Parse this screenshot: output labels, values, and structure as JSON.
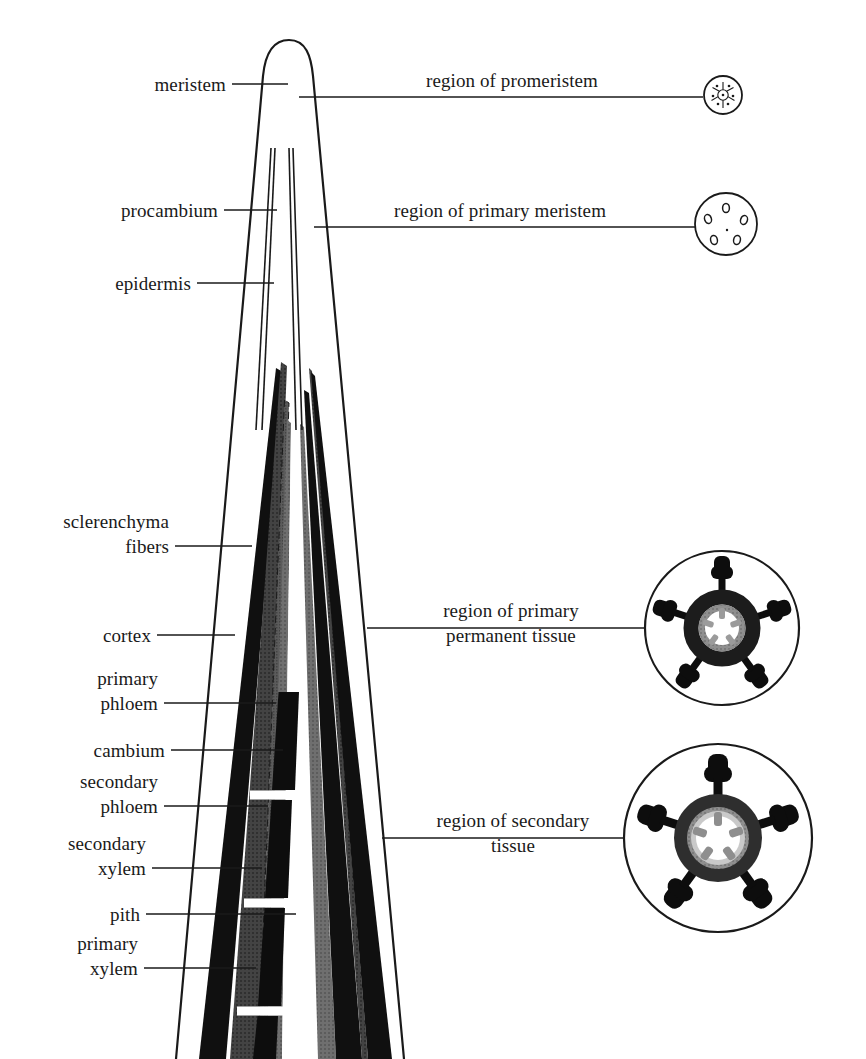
{
  "figure": {
    "background_color": "#ffffff",
    "line_color": "#1a1a1a"
  },
  "left_labels": [
    {
      "key": "meristem",
      "text": "meristem"
    },
    {
      "key": "procambium",
      "text": "procambium"
    },
    {
      "key": "epidermis",
      "text": "epidermis"
    },
    {
      "key": "sclerenchyma_fibers",
      "text": "sclerenchyma\nfibers"
    },
    {
      "key": "cortex",
      "text": "cortex"
    },
    {
      "key": "primary_phloem",
      "text": "primary\nphloem"
    },
    {
      "key": "cambium",
      "text": "cambium"
    },
    {
      "key": "secondary_phloem",
      "text": "secondary\nphloem"
    },
    {
      "key": "secondary_xylem",
      "text": "secondary\nxylem"
    },
    {
      "key": "pith",
      "text": "pith"
    },
    {
      "key": "primary_xylem",
      "text": "primary\nxylem"
    }
  ],
  "right_labels": [
    {
      "key": "promeristem",
      "text": "region of promeristem"
    },
    {
      "key": "primary_meristem",
      "text": "region of primary meristem"
    },
    {
      "key": "primary_permanent_tissue",
      "text": "region of primary\npermanent tissue"
    },
    {
      "key": "secondary_tissue",
      "text": "region of secondary\ntissue"
    }
  ],
  "cross_sections": [
    {
      "key": "promeristem-cross-section",
      "caption_ref": "region of promeristem"
    },
    {
      "key": "primary-meristem-cross-section",
      "caption_ref": "region of primary meristem"
    },
    {
      "key": "primary-permanent-cross-section",
      "caption_ref": "region of primary permanent tissue"
    },
    {
      "key": "secondary-cross-section",
      "caption_ref": "region of secondary tissue"
    }
  ],
  "tissue_colors": {
    "epidermis_outline": "#1a1a1a",
    "sclerenchyma_fibers": "#111111",
    "cortex": "#3d3d3d",
    "primary_phloem": "#111111",
    "cambium": "#555555",
    "secondary_phloem": "#111111",
    "secondary_xylem": "#111111",
    "pith": "#8a8a8a",
    "primary_xylem": "#707070",
    "procambium": "#1a1a1a"
  }
}
